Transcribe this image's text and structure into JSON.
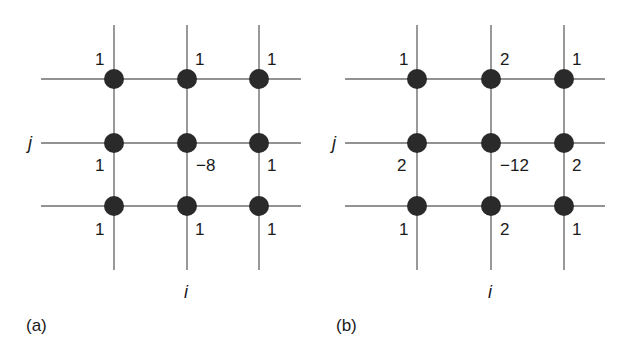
{
  "figure": {
    "panels": [
      {
        "id": "a",
        "tag": "(a)",
        "axis_i": "i",
        "axis_j": "j",
        "weights": [
          [
            "1",
            "1",
            "1"
          ],
          [
            "1",
            "−8",
            "1"
          ],
          [
            "1",
            "1",
            "1"
          ]
        ]
      },
      {
        "id": "b",
        "tag": "(b)",
        "axis_i": "i",
        "axis_j": "j",
        "weights": [
          [
            "1",
            "2",
            "1"
          ],
          [
            "2",
            "−12",
            "2"
          ],
          [
            "1",
            "2",
            "1"
          ]
        ]
      }
    ],
    "colors": {
      "line": "#6e6e6e",
      "node": "#2a2a2a",
      "text": "#1a1a1a"
    }
  }
}
